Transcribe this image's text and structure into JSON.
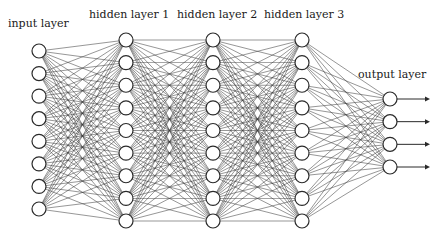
{
  "diagram": {
    "layers": [
      {
        "name": "input",
        "label": "input layer",
        "node_count": 8,
        "x": 39,
        "y_start": 51,
        "y_end": 209,
        "label_x": 8,
        "label_y": 27
      },
      {
        "name": "hidden-1",
        "label": "hidden layer 1",
        "node_count": 9,
        "x": 126,
        "y_start": 40,
        "y_end": 221,
        "label_x": 89,
        "label_y": 18
      },
      {
        "name": "hidden-2",
        "label": "hidden layer 2",
        "node_count": 9,
        "x": 213,
        "y_start": 40,
        "y_end": 221,
        "label_x": 177,
        "label_y": 18
      },
      {
        "name": "hidden-3",
        "label": "hidden layer 3",
        "node_count": 9,
        "x": 302,
        "y_start": 40,
        "y_end": 221,
        "label_x": 264,
        "label_y": 18
      },
      {
        "name": "output",
        "label": "output layer",
        "node_count": 4,
        "x": 390,
        "y_start": 99,
        "y_end": 167,
        "label_x": 358,
        "label_y": 78
      }
    ],
    "node_radius": 7,
    "output_arrow_end_x": 430,
    "connectivity": "fully-connected between consecutive layers"
  }
}
